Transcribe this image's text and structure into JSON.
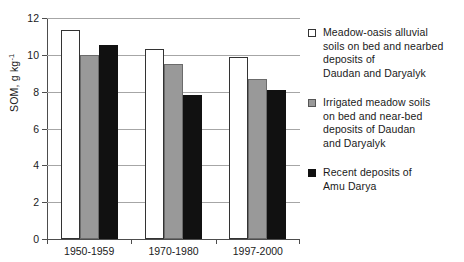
{
  "chart_data": {
    "type": "bar",
    "title": "",
    "xlabel": "",
    "ylabel": "SOM, g kg",
    "ylabel_exponent": "-1",
    "categories": [
      "1950-1959",
      "1970-1980",
      "1997-2000"
    ],
    "ylim": [
      0,
      12
    ],
    "ytick_labels": [
      "0",
      "2",
      "4",
      "6",
      "8",
      "10",
      "12"
    ],
    "ytick_values": [
      0,
      2,
      4,
      6,
      8,
      10,
      12
    ],
    "grid": "horizontal",
    "legend_position": "right",
    "series": [
      {
        "name": "Meadow-oasis alluvial\nsoils on bed and nearbed\ndeposits of\nDaudan and Daryalyk",
        "color": "#ffffff",
        "edge_color": "#333333",
        "swatch": "white",
        "values": [
          11.35,
          10.3,
          9.9
        ]
      },
      {
        "name": "Irrigated meadow soils\non bed and near-bed\ndeposits of Daudan\nand Daryalyk",
        "color": "#999999",
        "edge_color": "#6b6b6b",
        "swatch": "gray",
        "values": [
          10.0,
          9.5,
          8.7
        ]
      },
      {
        "name": "Recent deposits of\nAmu Darya",
        "color": "#111111",
        "edge_color": "#111111",
        "swatch": "black",
        "values": [
          10.55,
          7.8,
          8.1
        ]
      }
    ]
  },
  "axis": {
    "y_title_text": "SOM, g kg",
    "y_title_exponent": "-1"
  }
}
